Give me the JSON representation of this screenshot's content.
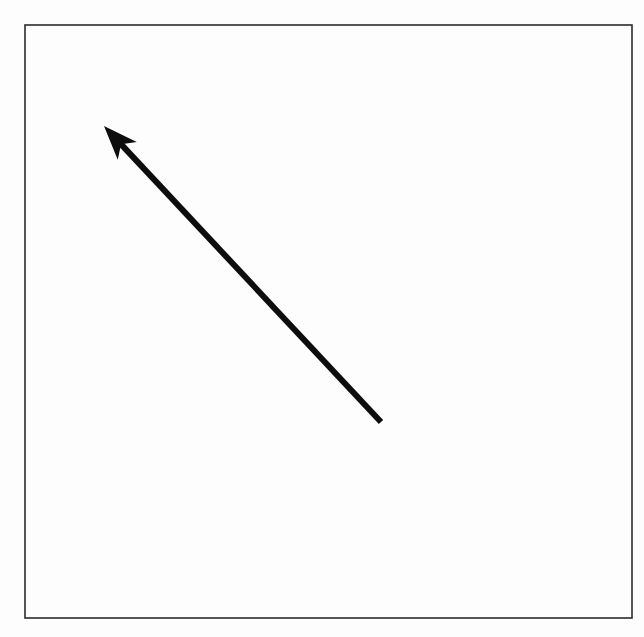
{
  "figure": {
    "title": "Arrow diagram",
    "canvas": {
      "width": 644,
      "height": 637,
      "background_color": "#fdfdfd",
      "inner_background_color": "#ffffff"
    },
    "frame": {
      "name": "border-rectangle",
      "x": 25,
      "y": 25,
      "width": 607,
      "height": 593,
      "stroke_color": "#2b2b2b",
      "stroke_width": 1.6,
      "fill": "none"
    },
    "arrow": {
      "name": "diagonal-arrow",
      "direction": "up-left",
      "tail_x": 381,
      "tail_y": 422,
      "tip_x": 104,
      "tip_y": 126,
      "stroke_color": "#0d0d0d",
      "stroke_width": 6,
      "head_style": "barbed-triangle",
      "head_length": 34,
      "head_half_width": 13,
      "head_notch": 9,
      "angle_degrees": 133,
      "length_px": 405
    }
  }
}
